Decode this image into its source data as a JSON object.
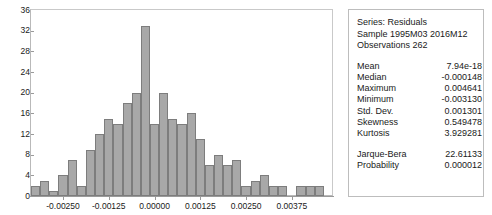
{
  "chart_data": {
    "type": "bar",
    "title": "",
    "xlabel": "",
    "ylabel": "",
    "ylim": [
      0,
      36
    ],
    "ytick_step": 4,
    "yticks": [
      0,
      4,
      8,
      12,
      16,
      20,
      24,
      28,
      32,
      36
    ],
    "xticks": [
      "-0.00250",
      "-0.00125",
      "0.00000",
      "0.00125",
      "0.00250",
      "0.00375"
    ],
    "xtick_values": [
      -0.0025,
      -0.00125,
      0.0,
      0.00125,
      0.0025,
      0.00375
    ],
    "xlim": [
      -0.003375,
      0.004875
    ],
    "grid": false,
    "legend": "none",
    "bin_width": 0.00025,
    "bin_centers": [
      -0.00325,
      -0.003,
      -0.00275,
      -0.0025,
      -0.00225,
      -0.002,
      -0.00175,
      -0.0015,
      -0.00125,
      -0.001,
      -0.00075,
      -0.0005,
      -0.00025,
      0.0,
      0.00025,
      0.0005,
      0.00075,
      0.001,
      0.00125,
      0.0015,
      0.00175,
      0.002,
      0.00225,
      0.0025,
      0.00275,
      0.003,
      0.00325,
      0.0035,
      0.00375,
      0.004,
      0.00425,
      0.0045
    ],
    "categories": [
      "-0.003250",
      "-0.003000",
      "-0.002750",
      "-0.002500",
      "-0.002250",
      "-0.002000",
      "-0.001750",
      "-0.001500",
      "-0.001250",
      "-0.001000",
      "-0.000750",
      "-0.000500",
      "-0.000250",
      "0.000000",
      "0.000250",
      "0.000500",
      "0.000750",
      "0.001000",
      "0.001250",
      "0.001500",
      "0.001750",
      "0.002000",
      "0.002250",
      "0.002500",
      "0.002750",
      "0.003000",
      "0.003250",
      "0.003500",
      "0.003750",
      "0.004000",
      "0.004250",
      "0.004500"
    ],
    "values": [
      2,
      3,
      1,
      4,
      7,
      2,
      9,
      12,
      15,
      14,
      18,
      20,
      33,
      14,
      20,
      15,
      14,
      16,
      11,
      6,
      8,
      6,
      7,
      2,
      3,
      4,
      2,
      2,
      0,
      2,
      2,
      2
    ]
  },
  "stats_panel": {
    "header": [
      "Series: Residuals",
      "Sample 1995M03 2016M12",
      "Observations 262"
    ],
    "rows": [
      {
        "key": "Mean",
        "value": "7.94e-18"
      },
      {
        "key": "Median",
        "value": "-0.000148"
      },
      {
        "key": "Maximum",
        "value": "0.004641"
      },
      {
        "key": "Minimum",
        "value": "-0.003130"
      },
      {
        "key": "Std. Dev.",
        "value": "0.001301"
      },
      {
        "key": "Skewness",
        "value": "0.549478"
      },
      {
        "key": "Kurtosis",
        "value": "3.929281"
      }
    ],
    "test_rows": [
      {
        "key": "Jarque-Bera",
        "value": "22.61133"
      },
      {
        "key": "Probability",
        "value": "0.000012"
      }
    ]
  },
  "colors": {
    "bar_fill": "#a8a8a8",
    "bar_stroke": "#7d7d7d",
    "axis": "#9a9a9a",
    "panel_border": "#bdbdbd",
    "text": "#1a1a1a",
    "background": "#ffffff"
  }
}
